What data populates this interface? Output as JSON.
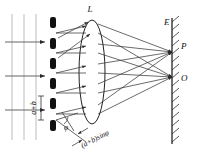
{
  "figure": {
    "type": "optics-ray-diagram",
    "colors": {
      "ink": "#1a1a1a",
      "ray": "#3a3a3a",
      "wavefront": "#b8b8b8",
      "grating_bar": "#111111",
      "background": "#ffffff"
    }
  },
  "labels": {
    "lens": "L",
    "screen": "E",
    "point_p": "P",
    "point_o": "O",
    "grating_period": "a+b",
    "path_difference": "(a+b)sinφ",
    "angle": "φ"
  },
  "incident_wave": {
    "wavefront_lines_x": [
      12,
      24,
      36
    ],
    "wavefront_y_top": 14,
    "wavefront_y_bottom": 140,
    "arrow_rows_y": [
      42,
      76,
      110
    ],
    "arrow_x_start": 6,
    "arrow_x_end": 44
  },
  "grating": {
    "x": 50,
    "bar_width": 6,
    "bar_count": 6,
    "bars_y": [
      17,
      38,
      58,
      78,
      98,
      120
    ],
    "bar_height": 11,
    "slit_y": [
      33,
      53,
      73,
      93,
      114
    ]
  },
  "lens": {
    "cx": 92,
    "cy": 72,
    "rx": 13,
    "ry": 52,
    "label_x": 90,
    "label_y": 12
  },
  "screen": {
    "x": 172,
    "y_top": 18,
    "y_bottom": 144,
    "hatch_count": 16,
    "label_x": 164,
    "label_y": 25
  },
  "focal_points": [
    {
      "name": "P",
      "x": 172,
      "y": 52,
      "label_x": 178,
      "label_y": 48
    },
    {
      "name": "O",
      "x": 172,
      "y": 77,
      "label_x": 178,
      "label_y": 80
    }
  ],
  "ray_bundles": {
    "to_P_source_y": [
      33,
      53,
      73,
      93,
      114
    ],
    "to_O_source_y": [
      33,
      53,
      73,
      93,
      114
    ]
  },
  "angle_marker": {
    "vertex_x": 60,
    "vertex_y": 120,
    "label_x": 66,
    "label_y": 128,
    "path_label_x": 92,
    "path_label_y": 139,
    "path_label_rotation": 27
  }
}
